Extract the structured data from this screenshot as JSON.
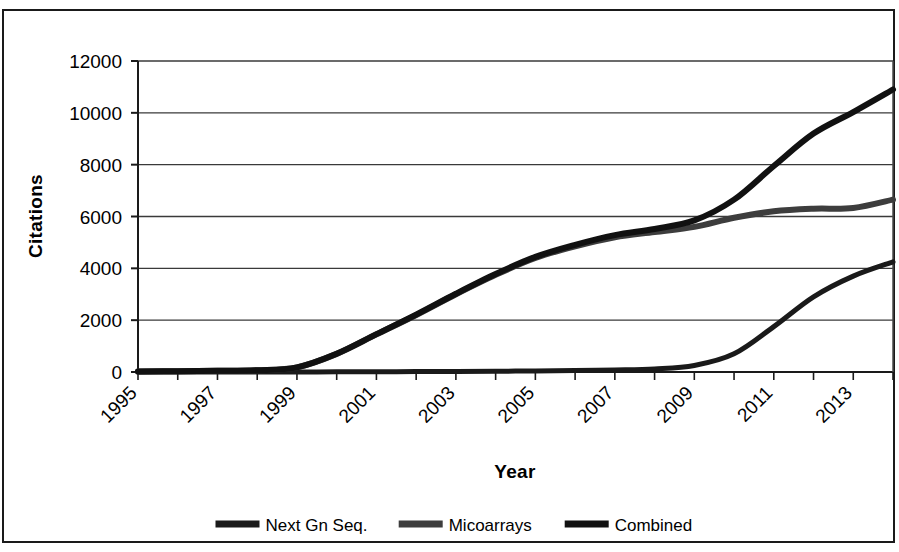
{
  "chart_data": {
    "type": "line",
    "title": "",
    "xlabel": "Year",
    "ylabel": "Citations",
    "xlim": [
      1995,
      2014
    ],
    "ylim": [
      0,
      12000
    ],
    "ytick_values": [
      0,
      2000,
      4000,
      6000,
      8000,
      10000,
      12000
    ],
    "ytick_labels": [
      "0",
      "2000",
      "4000",
      "6000",
      "8000",
      "10000",
      "12000"
    ],
    "xtick_values": [
      1995,
      1996,
      1997,
      1998,
      1999,
      2000,
      2001,
      2002,
      2003,
      2004,
      2005,
      2006,
      2007,
      2008,
      2009,
      2010,
      2011,
      2012,
      2013,
      2014
    ],
    "xtick_labels_shown": [
      "1995",
      "1997",
      "1999",
      "2001",
      "2003",
      "2005",
      "2007",
      "2009",
      "2011",
      "2013"
    ],
    "xtick_label_rotation": 45,
    "grid": "horizontal",
    "legend_position": "bottom",
    "x": [
      1995,
      1996,
      1997,
      1998,
      1999,
      2000,
      2001,
      2002,
      2003,
      2004,
      2005,
      2006,
      2007,
      2008,
      2009,
      2010,
      2011,
      2012,
      2013,
      2014
    ],
    "series": [
      {
        "name": "Next Gn Seq.",
        "color": "#1a1a1a",
        "width": 5,
        "values": [
          0,
          0,
          0,
          0,
          0,
          5,
          10,
          15,
          20,
          30,
          40,
          55,
          80,
          120,
          250,
          700,
          1750,
          2900,
          3700,
          4250
        ]
      },
      {
        "name": "Micoarrays",
        "color": "#3d3d3d",
        "width": 6,
        "values": [
          20,
          30,
          45,
          70,
          180,
          700,
          1450,
          2200,
          3000,
          3750,
          4400,
          4850,
          5200,
          5400,
          5600,
          5950,
          6200,
          6300,
          6330,
          6650
        ]
      },
      {
        "name": "Combined",
        "color": "#111111",
        "width": 6,
        "values": [
          20,
          30,
          45,
          70,
          180,
          705,
          1460,
          2215,
          3020,
          3780,
          4440,
          4905,
          5280,
          5520,
          5850,
          6650,
          7950,
          9200,
          10030,
          10900
        ]
      }
    ]
  },
  "axes": {
    "y_title": "Citations",
    "x_title": "Year"
  },
  "legend": {
    "items": [
      {
        "label": "Next Gn Seq.",
        "swatch": "line-swatch-dark"
      },
      {
        "label": "Micoarrays",
        "swatch": "line-swatch-gray"
      },
      {
        "label": "Combined",
        "swatch": "line-swatch-black"
      }
    ]
  }
}
